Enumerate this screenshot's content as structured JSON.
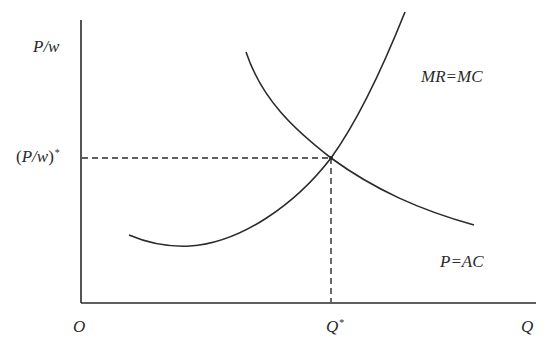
{
  "diagram": {
    "type": "economics-equilibrium",
    "axes": {
      "y_label": "P/w",
      "x_label": "Q",
      "origin_label": "O"
    },
    "equilibrium": {
      "y_label_base": "P/w",
      "y_label_sup": "*",
      "x_label_base": "Q",
      "x_label_sup": "*"
    },
    "curves": [
      {
        "name": "MR=MC",
        "label": "MR=MC",
        "shape": "U-shaped, rising steeply to upper right"
      },
      {
        "name": "P=AC",
        "label": "P=AC",
        "shape": "downward-sloping convex"
      }
    ],
    "colors": {
      "line": "#2a2a2a",
      "background": "#ffffff"
    }
  }
}
